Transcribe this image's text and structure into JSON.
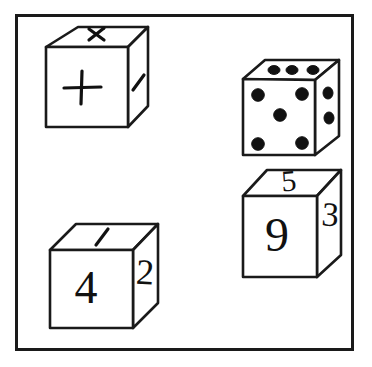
{
  "figure": {
    "background_color": "#ffffff",
    "ink_color": "#111111",
    "frame": {
      "label": "outer-border",
      "x": 15,
      "y": 14,
      "width": 338,
      "height": 336,
      "stroke_width": 3
    },
    "cubes": [
      {
        "id": "operator-cube",
        "position": "top-left",
        "kind": "symbol",
        "faces": {
          "top": "×",
          "front": "+",
          "right": "/"
        },
        "face_labels": {
          "top": "multiplication-sign",
          "front": "plus-sign",
          "right": "slash-divide-stroke"
        }
      },
      {
        "id": "die-cube",
        "position": "top-right",
        "kind": "die",
        "faces": {
          "top": 3,
          "front": 5,
          "right": 2
        },
        "pip_color": "#111111"
      },
      {
        "id": "number-cube-142",
        "position": "bottom-left",
        "kind": "number",
        "faces": {
          "top": "1",
          "front": "4",
          "right": "2"
        }
      },
      {
        "id": "number-cube-593",
        "position": "bottom-right",
        "kind": "number",
        "faces": {
          "top": "5",
          "front": "9",
          "right": "3"
        }
      }
    ]
  }
}
